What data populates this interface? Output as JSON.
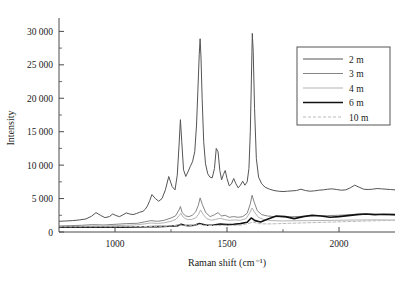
{
  "chart_data": {
    "type": "line",
    "title": "",
    "xlabel": "Raman shift (cm⁻¹)",
    "ylabel": "Intensity",
    "xlim": [
      750,
      2250
    ],
    "ylim": [
      0,
      32000
    ],
    "xticks": [
      1000,
      1500,
      2000
    ],
    "xticklabels": [
      "1000",
      "1500",
      "2000"
    ],
    "xminorticks": [
      750,
      1250,
      1750,
      2250
    ],
    "yticks": [
      0,
      5000,
      10000,
      15000,
      20000,
      25000,
      30000
    ],
    "yticklabels": [
      "0",
      "5 000",
      "10 000",
      "15 000",
      "20 000",
      "25 000",
      "30 000"
    ],
    "yminorticks": [
      2500,
      7500,
      12500,
      17500,
      22500,
      27500
    ],
    "grid": false,
    "legend_position": "upper-right",
    "series": [
      {
        "name": "2 m",
        "color": "#555555",
        "width": 1.0,
        "dash": "none",
        "x": [
          750,
          780,
          810,
          840,
          870,
          895,
          915,
          935,
          955,
          975,
          990,
          1005,
          1020,
          1035,
          1050,
          1065,
          1080,
          1095,
          1110,
          1125,
          1135,
          1145,
          1155,
          1165,
          1180,
          1195,
          1210,
          1225,
          1240,
          1255,
          1268,
          1278,
          1286,
          1292,
          1298,
          1306,
          1316,
          1326,
          1336,
          1346,
          1356,
          1364,
          1371,
          1376,
          1380,
          1384,
          1389,
          1396,
          1404,
          1414,
          1424,
          1434,
          1444,
          1452,
          1460,
          1468,
          1476,
          1484,
          1492,
          1500,
          1510,
          1520,
          1530,
          1540,
          1550,
          1560,
          1570,
          1580,
          1590,
          1598,
          1604,
          1609,
          1613,
          1617,
          1623,
          1631,
          1641,
          1655,
          1670,
          1690,
          1710,
          1730,
          1750,
          1770,
          1790,
          1810,
          1830,
          1850,
          1870,
          1890,
          1910,
          1930,
          1950,
          1970,
          1990,
          2010,
          2030,
          2050,
          2070,
          2090,
          2110,
          2130,
          2150,
          2170,
          2190,
          2210,
          2230,
          2250
        ],
        "y": [
          1600,
          1650,
          1700,
          1800,
          1950,
          2350,
          2900,
          2500,
          2150,
          2300,
          2700,
          2450,
          2300,
          2550,
          2850,
          2700,
          2600,
          2750,
          2950,
          3100,
          3400,
          3900,
          4700,
          5600,
          5000,
          4600,
          5000,
          6300,
          8300,
          6800,
          6300,
          8500,
          13000,
          16800,
          13500,
          9300,
          8300,
          9000,
          9800,
          10500,
          12000,
          16000,
          22000,
          26500,
          28900,
          26000,
          20000,
          13500,
          10200,
          8700,
          8200,
          8100,
          9500,
          12500,
          12000,
          9200,
          7800,
          8600,
          9200,
          8000,
          6900,
          7200,
          8000,
          7200,
          6600,
          7000,
          7600,
          7000,
          7500,
          9500,
          15000,
          23000,
          29700,
          27000,
          18500,
          11000,
          8200,
          7200,
          6700,
          6400,
          6200,
          6100,
          6050,
          6100,
          6150,
          6200,
          6400,
          6200,
          6100,
          6150,
          6250,
          6300,
          6400,
          6450,
          6350,
          6250,
          6300,
          6600,
          7000,
          6700,
          6400,
          6350,
          6400,
          6500,
          6450,
          6400,
          6350,
          6300
        ]
      },
      {
        "name": "3 m",
        "color": "#777777",
        "width": 0.9,
        "dash": "none",
        "x": [
          750,
          800,
          850,
          900,
          950,
          1000,
          1050,
          1100,
          1130,
          1160,
          1190,
          1220,
          1250,
          1270,
          1286,
          1292,
          1300,
          1315,
          1330,
          1345,
          1360,
          1372,
          1380,
          1390,
          1405,
          1425,
          1445,
          1460,
          1475,
          1492,
          1510,
          1530,
          1550,
          1570,
          1590,
          1604,
          1612,
          1620,
          1635,
          1655,
          1680,
          1710,
          1750,
          1800,
          1850,
          1900,
          1950,
          2000,
          2050,
          2100,
          2150,
          2200,
          2250
        ],
        "y": [
          900,
          950,
          1000,
          1100,
          1050,
          1150,
          1250,
          1300,
          1500,
          1700,
          1600,
          1750,
          2100,
          2400,
          3300,
          3800,
          2900,
          2400,
          2300,
          2500,
          3000,
          4000,
          5100,
          4100,
          2900,
          2300,
          2600,
          2900,
          2400,
          2500,
          2200,
          2300,
          2200,
          2300,
          2800,
          4200,
          5500,
          4600,
          3200,
          2600,
          2400,
          2300,
          2250,
          2300,
          2350,
          2400,
          2450,
          2500,
          2600,
          2700,
          2650,
          2600,
          2550
        ]
      },
      {
        "name": "4 m",
        "color": "#aaaaaa",
        "width": 0.9,
        "dash": "none",
        "x": [
          750,
          800,
          850,
          900,
          950,
          1000,
          1050,
          1100,
          1130,
          1160,
          1190,
          1220,
          1250,
          1272,
          1288,
          1294,
          1305,
          1320,
          1340,
          1360,
          1374,
          1382,
          1392,
          1410,
          1430,
          1450,
          1470,
          1490,
          1510,
          1535,
          1560,
          1585,
          1602,
          1612,
          1622,
          1640,
          1665,
          1700,
          1750,
          1800,
          1860,
          1920,
          1980,
          2040,
          2100,
          2160,
          2220,
          2250
        ],
        "y": [
          800,
          830,
          860,
          900,
          880,
          950,
          1000,
          1080,
          1200,
          1350,
          1280,
          1380,
          1600,
          1900,
          2500,
          2800,
          2200,
          1900,
          1850,
          2100,
          2700,
          3300,
          2700,
          2000,
          1750,
          1900,
          2050,
          1850,
          1750,
          1800,
          1750,
          2000,
          2900,
          3600,
          3000,
          2200,
          1850,
          1700,
          1650,
          1680,
          1700,
          1720,
          1750,
          1780,
          1800,
          1820,
          1800,
          1790
        ]
      },
      {
        "name": "6 m",
        "color": "#111111",
        "width": 1.6,
        "dash": "none",
        "x": [
          750,
          820,
          890,
          960,
          1030,
          1090,
          1140,
          1190,
          1240,
          1280,
          1295,
          1310,
          1330,
          1355,
          1375,
          1390,
          1410,
          1440,
          1470,
          1500,
          1530,
          1560,
          1590,
          1608,
          1625,
          1650,
          1680,
          1720,
          1760,
          1800,
          1840,
          1880,
          1920,
          1960,
          2000,
          2040,
          2080,
          2120,
          2160,
          2200,
          2250
        ],
        "y": [
          700,
          700,
          710,
          700,
          720,
          740,
          780,
          800,
          850,
          950,
          1150,
          1000,
          950,
          1000,
          1250,
          1150,
          1000,
          1050,
          1200,
          1100,
          1150,
          1250,
          1450,
          2100,
          1700,
          1500,
          1900,
          2400,
          2300,
          2000,
          2300,
          2500,
          2400,
          2200,
          2300,
          2450,
          2600,
          2700,
          2600,
          2650,
          2600
        ]
      },
      {
        "name": "10 m",
        "color": "#bbbbbb",
        "width": 1.0,
        "dash": "3 2",
        "x": [
          750,
          830,
          910,
          990,
          1060,
          1120,
          1180,
          1240,
          1290,
          1310,
          1340,
          1375,
          1400,
          1440,
          1480,
          1520,
          1560,
          1600,
          1615,
          1640,
          1680,
          1730,
          1780,
          1830,
          1880,
          1930,
          1980,
          2030,
          2080,
          2130,
          2180,
          2250
        ],
        "y": [
          780,
          780,
          790,
          780,
          800,
          820,
          840,
          880,
          1050,
          950,
          930,
          1150,
          1000,
          980,
          1000,
          980,
          1020,
          1300,
          1500,
          1250,
          1200,
          1250,
          1300,
          1350,
          1400,
          1450,
          1500,
          1550,
          1600,
          1650,
          1700,
          1750
        ]
      }
    ]
  },
  "legend": {
    "entries": [
      {
        "label": "2 m"
      },
      {
        "label": "3 m"
      },
      {
        "label": "4 m"
      },
      {
        "label": "6 m"
      },
      {
        "label": "10 m"
      }
    ]
  }
}
